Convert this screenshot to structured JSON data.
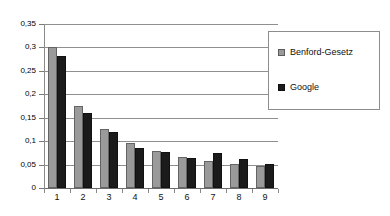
{
  "chart_data": {
    "type": "bar",
    "title": "",
    "subtitle": "",
    "xlabel": "",
    "ylabel": "",
    "categories": [
      "1",
      "2",
      "3",
      "4",
      "5",
      "6",
      "7",
      "8",
      "9"
    ],
    "series": [
      {
        "name": "Benford-Gesetz",
        "color": "#9a9a9a",
        "values": [
          0.301,
          0.176,
          0.125,
          0.097,
          0.079,
          0.067,
          0.058,
          0.051,
          0.046
        ]
      },
      {
        "name": "Google",
        "color": "#1b1b1b",
        "values": [
          0.282,
          0.161,
          0.119,
          0.086,
          0.077,
          0.064,
          0.075,
          0.062,
          0.052
        ]
      }
    ],
    "ylim": [
      0,
      0.35
    ],
    "ytick_values": [
      0,
      0.05,
      0.1,
      0.15,
      0.2,
      0.25,
      0.3,
      0.35
    ],
    "ytick_labels": [
      "0",
      "0,05",
      "0,1",
      "0,15",
      "0,2",
      "0,25",
      "0,3",
      "0,35"
    ],
    "grid": true,
    "grid_axis": "y",
    "legend_position": "right",
    "decimal_separator": ","
  },
  "legend": {
    "entries": [
      {
        "label": "Benford-Gesetz"
      },
      {
        "label": "Google"
      }
    ]
  }
}
